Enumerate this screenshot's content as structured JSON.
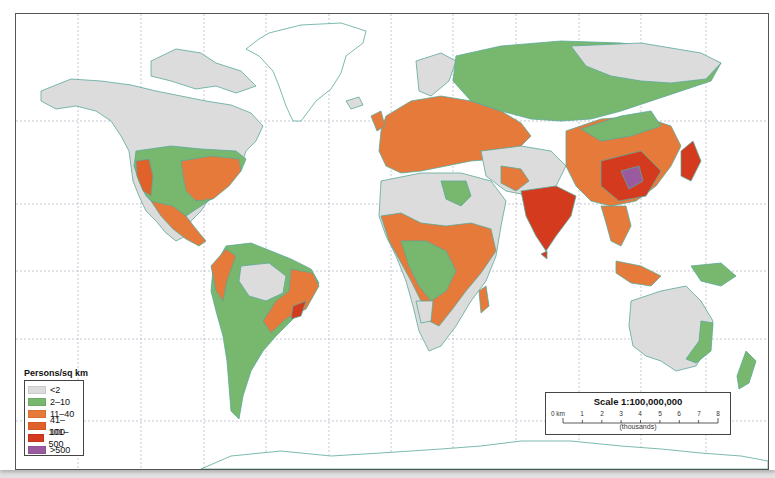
{
  "map": {
    "type": "choropleth world map",
    "subject": "World population density",
    "colors": {
      "ocean": "#ffffff",
      "land_under_2": "#dcdcdc",
      "coastline": "#5aa89a",
      "border": "#6a6a8a",
      "grid": "#b8b8c8"
    }
  },
  "legend": {
    "title": "Persons/sq km",
    "items": [
      {
        "label": "<2",
        "color": "#dcdcdc"
      },
      {
        "label": "2–10",
        "color": "#78b86e"
      },
      {
        "label": "11–40",
        "color": "#e67a3a"
      },
      {
        "label": "41–100",
        "color": "#e0622a"
      },
      {
        "label": "101–500",
        "color": "#d43a1e"
      },
      {
        "label": ">500",
        "color": "#9a5a9e"
      }
    ]
  },
  "scale_bar": {
    "title": "Scale 1:100,000,000",
    "ticks": [
      "0 km",
      "1",
      "2",
      "3",
      "4",
      "5",
      "6",
      "7",
      "8"
    ],
    "units": "(thousands)"
  }
}
